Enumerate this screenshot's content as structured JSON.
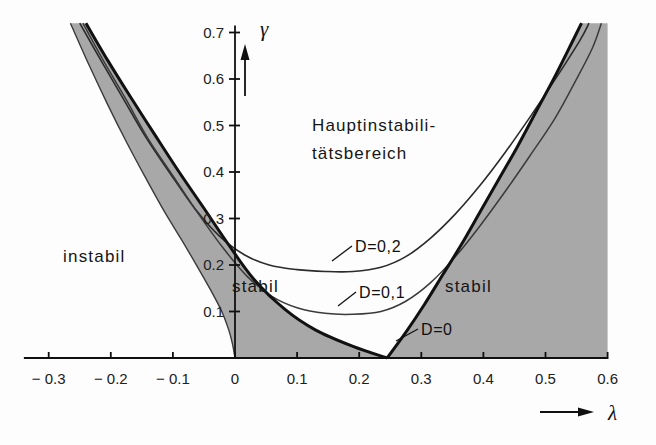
{
  "figure": {
    "background": "#fdfdfd",
    "shaded_color": "#a8a8a8",
    "line_color": "#111111",
    "thin_line_color": "#2b2b2b"
  },
  "axes": {
    "x": {
      "name": "λ",
      "arrow": "→",
      "ticks": [
        "-0.3",
        "-0.2",
        "-0.1",
        "0",
        "0.1",
        "0.2",
        "0.3",
        "0.4",
        "0.5",
        "0.6"
      ],
      "values": [
        -0.3,
        -0.2,
        -0.1,
        0,
        0.1,
        0.2,
        0.3,
        0.4,
        0.5,
        0.6
      ],
      "min": -0.34,
      "max": 0.6
    },
    "y": {
      "name": "γ",
      "arrow": "↑",
      "ticks": [
        "0.1",
        "0.2",
        "0.3",
        "0.4",
        "0.5",
        "0.6",
        "0.7"
      ],
      "values": [
        0.1,
        0.2,
        0.3,
        0.4,
        0.5,
        0.6,
        0.7
      ],
      "min": 0,
      "max": 0.72
    }
  },
  "regions": [
    {
      "key": "instabil-left",
      "label": "instabil",
      "fill": "white"
    },
    {
      "key": "stabil-left",
      "label": "stabil",
      "fill": "gray"
    },
    {
      "key": "hauptinstabil",
      "label_line1": "Hauptinstabili-",
      "label_line2": "tätsbereich",
      "fill": "white"
    },
    {
      "key": "stabil-right",
      "label": "stabil",
      "fill": "gray"
    }
  ],
  "curves": [
    {
      "key": "d0",
      "label": "D=0",
      "damping": 0.0
    },
    {
      "key": "d01",
      "label": "D=0,1",
      "damping": 0.1
    },
    {
      "key": "d02",
      "label": "D=0,2",
      "damping": 0.2
    }
  ],
  "chart_data": {
    "type": "line",
    "title": "",
    "xlabel": "λ",
    "ylabel": "γ",
    "xlim": [
      -0.34,
      0.6
    ],
    "ylim": [
      0.0,
      0.72
    ],
    "grid": false,
    "legend": "inline-annotations",
    "xticks": [
      -0.3,
      -0.2,
      -0.1,
      0,
      0.1,
      0.2,
      0.3,
      0.4,
      0.5,
      0.6
    ],
    "yticks": [
      0.1,
      0.2,
      0.3,
      0.4,
      0.5,
      0.6,
      0.7
    ],
    "annotations": [
      {
        "text": "instabil",
        "x": -0.215,
        "y": 0.205
      },
      {
        "text": "stabil",
        "x": 0.055,
        "y": 0.155
      },
      {
        "text": "Hauptinstabili-",
        "x": 0.125,
        "y": 0.515
      },
      {
        "text": "tätsbereich",
        "x": 0.125,
        "y": 0.455
      },
      {
        "text": "stabil",
        "x": 0.395,
        "y": 0.155
      },
      {
        "text": "D=0,2",
        "x": 0.225,
        "y": 0.275
      },
      {
        "text": "D=0,1",
        "x": 0.235,
        "y": 0.195
      },
      {
        "text": "D=0",
        "x": 0.305,
        "y": 0.065
      }
    ],
    "series": [
      {
        "name": "D=0 (left branch)",
        "comment": "upper boundary of shaded stable wedge, left side",
        "points": [
          [
            -0.24,
            0.72
          ],
          [
            -0.205,
            0.64
          ],
          [
            -0.17,
            0.565
          ],
          [
            -0.13,
            0.482
          ],
          [
            -0.09,
            0.4
          ],
          [
            -0.05,
            0.322
          ],
          [
            -0.01,
            0.243
          ],
          [
            0.03,
            0.17
          ],
          [
            0.08,
            0.105
          ],
          [
            0.13,
            0.06
          ],
          [
            0.19,
            0.025
          ],
          [
            0.245,
            0.0
          ]
        ]
      },
      {
        "name": "D=0 (left lower branch)",
        "comment": "lower-left boundary separating instabil from stabil",
        "points": [
          [
            -0.265,
            0.72
          ],
          [
            -0.235,
            0.63
          ],
          [
            -0.205,
            0.545
          ],
          [
            -0.175,
            0.465
          ],
          [
            -0.145,
            0.39
          ],
          [
            -0.115,
            0.318
          ],
          [
            -0.085,
            0.252
          ],
          [
            -0.06,
            0.195
          ],
          [
            -0.04,
            0.148
          ],
          [
            -0.022,
            0.102
          ],
          [
            -0.01,
            0.06
          ],
          [
            -0.004,
            0.03
          ],
          [
            0.0,
            0.0
          ]
        ]
      },
      {
        "name": "D=0 (right branch)",
        "comment": "boundary of shaded stable wedge, right side",
        "points": [
          [
            0.245,
            0.0
          ],
          [
            0.275,
            0.055
          ],
          [
            0.305,
            0.115
          ],
          [
            0.335,
            0.18
          ],
          [
            0.365,
            0.245
          ],
          [
            0.395,
            0.315
          ],
          [
            0.425,
            0.385
          ],
          [
            0.455,
            0.455
          ],
          [
            0.485,
            0.53
          ],
          [
            0.515,
            0.605
          ],
          [
            0.545,
            0.685
          ],
          [
            0.558,
            0.72
          ]
        ]
      },
      {
        "name": "D=0,1",
        "comment": "rounded transition curve, damping 0.1",
        "points": [
          [
            -0.245,
            0.72
          ],
          [
            -0.21,
            0.635
          ],
          [
            -0.175,
            0.555
          ],
          [
            -0.14,
            0.472
          ],
          [
            -0.1,
            0.392
          ],
          [
            -0.06,
            0.312
          ],
          [
            -0.02,
            0.238
          ],
          [
            0.02,
            0.175
          ],
          [
            0.06,
            0.132
          ],
          [
            0.1,
            0.108
          ],
          [
            0.145,
            0.096
          ],
          [
            0.19,
            0.094
          ],
          [
            0.235,
            0.1
          ],
          [
            0.275,
            0.122
          ],
          [
            0.315,
            0.162
          ],
          [
            0.355,
            0.218
          ],
          [
            0.395,
            0.285
          ],
          [
            0.435,
            0.358
          ],
          [
            0.475,
            0.435
          ],
          [
            0.515,
            0.515
          ],
          [
            0.548,
            0.595
          ],
          [
            0.575,
            0.665
          ],
          [
            0.59,
            0.72
          ]
        ]
      },
      {
        "name": "D=0,2",
        "comment": "rounded transition curve, damping 0.2",
        "points": [
          [
            -0.25,
            0.72
          ],
          [
            -0.215,
            0.638
          ],
          [
            -0.18,
            0.558
          ],
          [
            -0.145,
            0.478
          ],
          [
            -0.105,
            0.398
          ],
          [
            -0.065,
            0.322
          ],
          [
            -0.025,
            0.262
          ],
          [
            0.015,
            0.222
          ],
          [
            0.055,
            0.2
          ],
          [
            0.1,
            0.19
          ],
          [
            0.145,
            0.186
          ],
          [
            0.19,
            0.186
          ],
          [
            0.235,
            0.195
          ],
          [
            0.275,
            0.218
          ],
          [
            0.315,
            0.258
          ],
          [
            0.355,
            0.31
          ],
          [
            0.395,
            0.372
          ],
          [
            0.435,
            0.442
          ],
          [
            0.475,
            0.518
          ],
          [
            0.515,
            0.598
          ],
          [
            0.555,
            0.682
          ],
          [
            0.57,
            0.72
          ]
        ]
      }
    ]
  }
}
